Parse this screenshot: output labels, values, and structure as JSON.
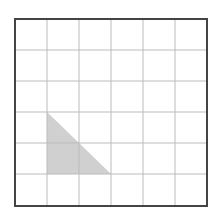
{
  "diagram": {
    "type": "grid-with-shaded-triangle",
    "grid": {
      "columns": 6,
      "rows": 6,
      "x_lines": [
        15,
        47,
        79,
        111,
        143,
        175,
        207
      ],
      "y_lines": [
        19,
        50,
        81,
        112,
        143,
        174,
        206
      ],
      "border_color": "#444444",
      "line_color": "#bbbbbb"
    },
    "shaded_triangle": {
      "vertices_grid": [
        [
          1,
          3
        ],
        [
          1,
          5
        ],
        [
          3,
          5
        ]
      ],
      "vertices_px": [
        [
          47,
          112
        ],
        [
          47,
          174
        ],
        [
          111,
          174
        ]
      ],
      "fill_color": "#d0d0d0",
      "width_cells": 2,
      "height_cells": 2
    }
  }
}
